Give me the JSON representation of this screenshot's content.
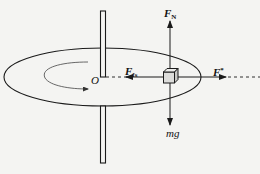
{
  "diagram": {
    "type": "physics-free-body-diagram",
    "labels": {
      "normal_force": {
        "main": "F",
        "sub": "N"
      },
      "friction_force": {
        "main": "F",
        "sub": "fs"
      },
      "fictitious_force": {
        "main": "F",
        "sup": "*"
      },
      "weight": "mg",
      "origin": "O"
    },
    "colors": {
      "stroke": "#1a1a1a",
      "background": "#f4f4f2",
      "cube_fill": "#d8d8d6"
    }
  }
}
